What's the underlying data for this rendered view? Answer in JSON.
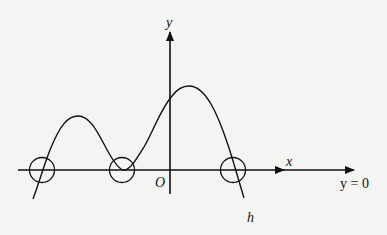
{
  "diagram": {
    "type": "function-graph",
    "labels": {
      "y_axis": "y",
      "x_axis": "x",
      "origin": "O",
      "asymptote": "y = 0",
      "curve": "h"
    },
    "colors": {
      "background": "#f4f4f2",
      "stroke": "#111111"
    },
    "annotations": [
      {
        "name": "root-circle-left",
        "meaning": "curve crosses x-axis"
      },
      {
        "name": "root-circle-middle",
        "meaning": "curve touches x-axis (double root)"
      },
      {
        "name": "root-circle-right",
        "meaning": "curve crosses x-axis"
      }
    ]
  }
}
